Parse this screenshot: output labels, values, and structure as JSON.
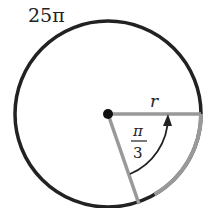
{
  "diagram": {
    "circumference_label": "25π",
    "radius_label": "r",
    "angle_label": {
      "numerator": "π",
      "denominator": "3"
    },
    "colors": {
      "circle": "#222222",
      "sector": "#999999",
      "center": "#111111",
      "arrow": "#222222"
    }
  }
}
